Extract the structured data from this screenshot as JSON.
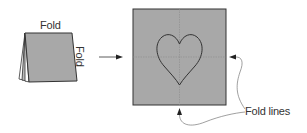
{
  "diagram": {
    "folded_paper": {
      "top_label": "Fold",
      "side_label": "Fold"
    },
    "unfolded_paper": {
      "shape": "heart",
      "callout_label": "Fold lines"
    },
    "colors": {
      "paper": "#a8a8a8",
      "stroke": "#333333",
      "fold_line": "#8a8a8a"
    }
  }
}
